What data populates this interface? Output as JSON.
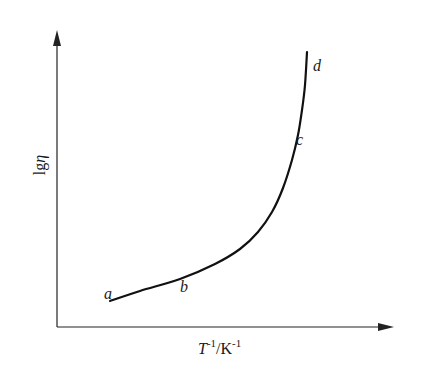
{
  "chart_data": {
    "type": "line",
    "title": "",
    "xlabel": "T^-1/K^-1",
    "ylabel": "lgη",
    "xlabel_parts": {
      "base": "T",
      "base_sup": "-1",
      "sep": "/K",
      "unit_sup": "-1"
    },
    "ylabel_parts": {
      "prefix": "lg",
      "symbol": "η"
    },
    "grid": false,
    "legend": null,
    "ticks": "none",
    "series": [
      {
        "name": "viscosity curve",
        "description": "lgη vs 1/T, gently rising from a to b, then curving steeply upward through c to d",
        "points_pixel": [
          [
            110,
            301
          ],
          [
            140,
            291
          ],
          [
            180,
            279
          ],
          [
            215,
            264
          ],
          [
            240,
            249
          ],
          [
            258,
            232
          ],
          [
            272,
            212
          ],
          [
            283,
            188
          ],
          [
            292,
            160
          ],
          [
            298,
            135
          ],
          [
            302,
            110
          ],
          [
            305,
            85
          ],
          [
            307,
            52
          ]
        ]
      }
    ],
    "annotations": [
      {
        "label": "a",
        "x": 104,
        "y": 299
      },
      {
        "label": "b",
        "x": 180,
        "y": 292
      },
      {
        "label": "c",
        "x": 296,
        "y": 145
      },
      {
        "label": "d",
        "x": 313,
        "y": 71
      }
    ]
  }
}
